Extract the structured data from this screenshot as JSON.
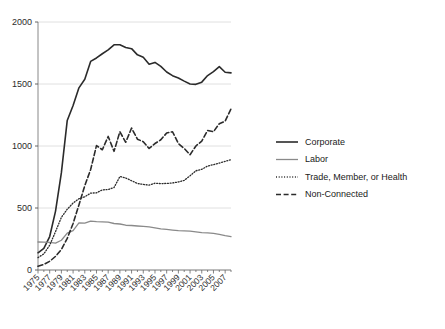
{
  "chart_data": {
    "type": "line",
    "title": "",
    "xlabel": "",
    "ylabel": "",
    "xlim": [
      1975,
      2008
    ],
    "ylim": [
      0,
      2000
    ],
    "grid": true,
    "legend_position": "right",
    "y_ticks": [
      "0",
      "500",
      "1000",
      "1500",
      "2000"
    ],
    "y_tick_values": [
      0,
      500,
      1000,
      1500,
      2000
    ],
    "x_ticks": [
      "1975",
      "1977",
      "1979",
      "1981",
      "1983",
      "1985",
      "1987",
      "1989",
      "1991",
      "1993",
      "1995",
      "1997",
      "1999",
      "2001",
      "2003",
      "2005",
      "2007"
    ],
    "x": [
      1975,
      1976,
      1977,
      1978,
      1979,
      1980,
      1981,
      1982,
      1983,
      1984,
      1985,
      1986,
      1987,
      1988,
      1989,
      1990,
      1991,
      1992,
      1993,
      1994,
      1995,
      1996,
      1997,
      1998,
      1999,
      2000,
      2001,
      2002,
      2003,
      2004,
      2005,
      2006,
      2007,
      2008
    ],
    "series": [
      {
        "name": "Corporate",
        "style": "solid",
        "color": "#2b2b2b",
        "width": 1.6,
        "values": [
          139,
          175,
          270,
          475,
          785,
          1206,
          1327,
          1469,
          1538,
          1682,
          1710,
          1744,
          1775,
          1816,
          1817,
          1795,
          1785,
          1735,
          1715,
          1660,
          1674,
          1642,
          1597,
          1567,
          1548,
          1523,
          1500,
          1497,
          1515,
          1568,
          1600,
          1640,
          1595,
          1590
        ]
      },
      {
        "name": "Labor",
        "style": "solid",
        "color": "#8a8a8a",
        "width": 1.3,
        "values": [
          226,
          224,
          222,
          217,
          240,
          297,
          318,
          380,
          378,
          394,
          390,
          388,
          386,
          375,
          371,
          361,
          359,
          355,
          352,
          347,
          340,
          332,
          327,
          322,
          318,
          316,
          314,
          308,
          302,
          300,
          295,
          288,
          278,
          270
        ]
      },
      {
        "name": "Trade, Member, or Health",
        "style": "dotted",
        "color": "#2b2b2b",
        "width": 1.3,
        "values": [
          100,
          130,
          200,
          310,
          425,
          490,
          540,
          575,
          590,
          620,
          622,
          646,
          649,
          665,
          754,
          742,
          720,
          698,
          690,
          685,
          700,
          697,
          698,
          702,
          710,
          723,
          760,
          800,
          812,
          838,
          850,
          862,
          876,
          890
        ]
      },
      {
        "name": "Non-Connected",
        "style": "dashed",
        "color": "#2b2b2b",
        "width": 1.6,
        "values": [
          30,
          45,
          70,
          110,
          165,
          255,
          375,
          525,
          680,
          810,
          1003,
          970,
          1077,
          957,
          1115,
          1030,
          1145,
          1055,
          1035,
          980,
          1020,
          1050,
          1105,
          1115,
          1020,
          980,
          930,
          1000,
          1040,
          1125,
          1115,
          1180,
          1200,
          1300
        ]
      }
    ]
  },
  "legend": {
    "items": [
      {
        "label": "Corporate"
      },
      {
        "label": "Labor"
      },
      {
        "label": "Trade, Member, or Health"
      },
      {
        "label": "Non-Connected"
      }
    ]
  }
}
